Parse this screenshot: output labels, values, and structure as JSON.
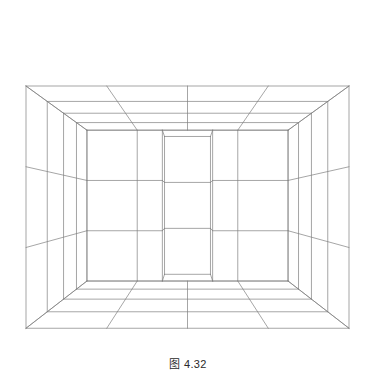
{
  "figure": {
    "caption": "图 4.32",
    "kind": "line-drawing",
    "background_color": "#ffffff",
    "line_color": "#808080",
    "line_width": 0.7,
    "canvas": {
      "width": 376,
      "height": 391
    }
  },
  "chart_data": {
    "type": "line",
    "title": "图 4.32",
    "xlabel": "",
    "ylabel": "",
    "projection": {
      "type": "two-point-perspective",
      "ceiling_apex": [
        185,
        21
      ],
      "floor_apex": [
        186,
        341
      ],
      "left_wall_top_corner": [
        26,
        86
      ],
      "left_wall_bottom_corner": [
        27,
        263
      ],
      "right_wall_top_corner": [
        349,
        92
      ],
      "right_wall_bottom_corner": [
        350,
        246
      ],
      "back_corner_top": [
        186,
        118
      ],
      "back_corner_bottom": [
        186,
        228
      ]
    },
    "geometry": {
      "room": {
        "width": 4,
        "depth": 4,
        "height": 3
      },
      "ceiling_grid": {
        "rows": 4,
        "cols": 4
      },
      "floor_grid": {
        "rows": 4,
        "cols": 4
      },
      "wall_courses": 3,
      "wall_bays_per_side": 4,
      "alcove": {
        "width": 1,
        "depth": 1,
        "present": true
      }
    },
    "camera": {
      "eye": [
        2.0,
        -6.6,
        1.55
      ],
      "target": [
        2.0,
        2.0,
        1.55
      ],
      "focal": 300,
      "roll_deg": 0
    },
    "legend": [],
    "grid": true
  }
}
